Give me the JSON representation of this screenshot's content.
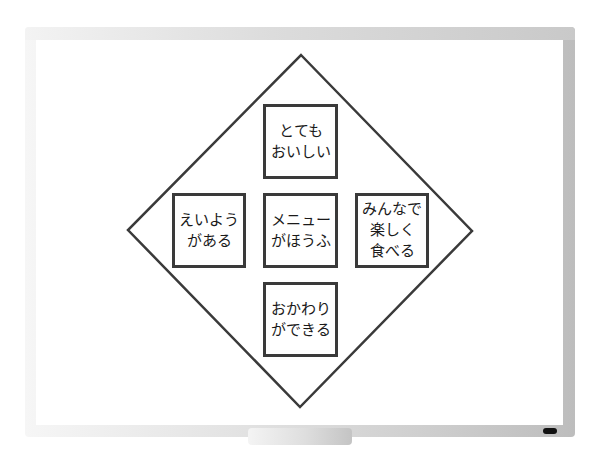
{
  "whiteboard": {
    "frame_color": "#c4c4c4",
    "line_color": "#3a3a3a",
    "marker_color": "#111111"
  },
  "diagram": {
    "shape": "diamond",
    "boxes": {
      "top": {
        "lines": [
          "とても",
          "おいしい"
        ]
      },
      "left": {
        "lines": [
          "えいよう",
          "がある"
        ]
      },
      "center": {
        "lines": [
          "メニュー",
          "がほうふ"
        ]
      },
      "right": {
        "lines": [
          "みんなで",
          "楽しく",
          "食べる"
        ]
      },
      "bottom": {
        "lines": [
          "おかわり",
          "ができる"
        ]
      }
    }
  }
}
